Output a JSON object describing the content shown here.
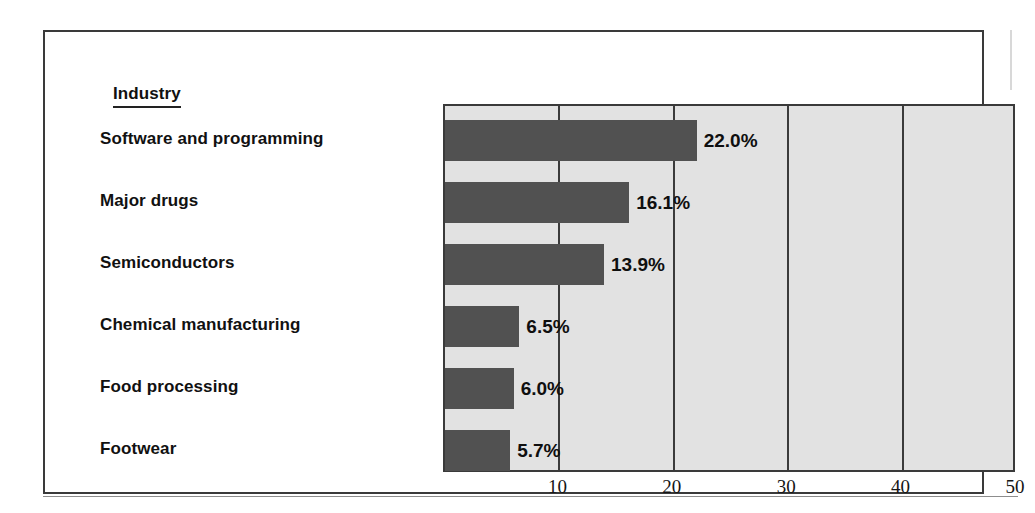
{
  "figure": {
    "column_header": "Industry"
  },
  "chart_data": {
    "type": "bar",
    "orientation": "horizontal",
    "title": "",
    "xlabel": "",
    "ylabel": "Industry",
    "xlim": [
      0,
      50
    ],
    "xticks": [
      10,
      20,
      30,
      40,
      50
    ],
    "xtick_labels": [
      "10",
      "20",
      "30",
      "40",
      "50"
    ],
    "grid": true,
    "legend": "none",
    "bar_color": "#515151",
    "plot_background": "#e2e2e2",
    "categories": [
      "Software and programming",
      "Major drugs",
      "Semiconductors",
      "Chemical manufacturing",
      "Food processing",
      "Footwear"
    ],
    "values": [
      22.0,
      16.1,
      13.9,
      6.5,
      6.0,
      5.7
    ],
    "value_labels": [
      "22.0%",
      "16.1%",
      "13.9%",
      "6.5%",
      "6.0%",
      "5.7%"
    ]
  }
}
